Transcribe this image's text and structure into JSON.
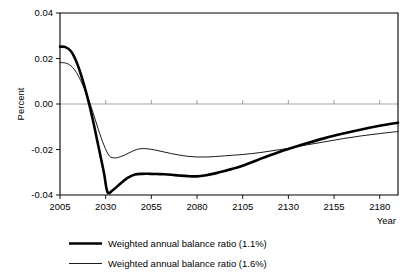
{
  "chart_data": {
    "type": "line",
    "title": "",
    "xlabel": "Year",
    "ylabel": "Percent",
    "xlim": [
      2005,
      2190
    ],
    "ylim": [
      -0.04,
      0.04
    ],
    "grid": false,
    "legend_position": "bottom",
    "xticks": [
      2005,
      2030,
      2055,
      2080,
      2105,
      2130,
      2155,
      2180
    ],
    "xtick_labels": [
      "2005",
      "2030",
      "2055",
      "2080",
      "2105",
      "2130",
      "2155",
      "2180"
    ],
    "yticks": [
      0.04,
      0.02,
      0.0,
      -0.02,
      -0.04
    ],
    "ytick_labels": [
      "0.04",
      "0.02",
      "0.00",
      "-0.02",
      "-0.04"
    ],
    "series": [
      {
        "name": "Weighted annual balance ratio (1.1%)",
        "style": "thick",
        "color": "#000000",
        "x": [
          2005,
          2008,
          2011,
          2014,
          2017,
          2020,
          2023,
          2026,
          2029,
          2031,
          2034,
          2038,
          2042,
          2046,
          2050,
          2054,
          2058,
          2062,
          2066,
          2070,
          2075,
          2080,
          2085,
          2090,
          2095,
          2100,
          2105,
          2110,
          2115,
          2120,
          2125,
          2130,
          2140,
          2150,
          2160,
          2170,
          2180,
          2190
        ],
        "y": [
          0.0252,
          0.025,
          0.0232,
          0.0186,
          0.0116,
          0.003,
          -0.007,
          -0.0185,
          -0.03,
          -0.0387,
          -0.0378,
          -0.035,
          -0.0325,
          -0.031,
          -0.0307,
          -0.0307,
          -0.0308,
          -0.0309,
          -0.0311,
          -0.0314,
          -0.0317,
          -0.0318,
          -0.0313,
          -0.0305,
          -0.0295,
          -0.0284,
          -0.0271,
          -0.0256,
          -0.024,
          -0.0225,
          -0.0211,
          -0.0198,
          -0.0173,
          -0.015,
          -0.013,
          -0.0112,
          -0.0096,
          -0.0082
        ]
      },
      {
        "name": "Weighted annual balance ratio (1.6%)",
        "style": "thin",
        "color": "#000000",
        "x": [
          2005,
          2008,
          2011,
          2014,
          2017,
          2020,
          2023,
          2026,
          2029,
          2032,
          2035,
          2038,
          2041,
          2044,
          2047,
          2050,
          2054,
          2058,
          2062,
          2066,
          2070,
          2075,
          2080,
          2085,
          2090,
          2095,
          2100,
          2105,
          2110,
          2115,
          2120,
          2125,
          2130,
          2140,
          2150,
          2160,
          2170,
          2180,
          2190
        ],
        "y": [
          0.0182,
          0.018,
          0.0168,
          0.0138,
          0.0092,
          0.0034,
          -0.0036,
          -0.0112,
          -0.018,
          -0.0228,
          -0.0237,
          -0.0232,
          -0.0222,
          -0.021,
          -0.02,
          -0.0196,
          -0.0198,
          -0.0204,
          -0.0211,
          -0.0218,
          -0.0224,
          -0.023,
          -0.0233,
          -0.0233,
          -0.0231,
          -0.0228,
          -0.0225,
          -0.0222,
          -0.0218,
          -0.0213,
          -0.0207,
          -0.0201,
          -0.0195,
          -0.018,
          -0.0166,
          -0.0152,
          -0.014,
          -0.013,
          -0.0121
        ]
      }
    ]
  },
  "legend": {
    "entries": [
      {
        "label": "Weighted annual balance ratio (1.1%)",
        "style": "thick"
      },
      {
        "label": "Weighted annual balance ratio (1.6%)",
        "style": "thin"
      }
    ]
  },
  "axes": {
    "y_title": "Percent",
    "x_title": "Year"
  }
}
